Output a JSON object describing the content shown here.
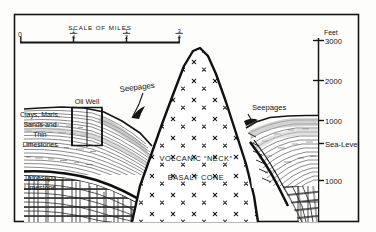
{
  "figure": {
    "kind": "geological-cross-section",
    "scale_bar": {
      "title": "SCALE OF MILES",
      "ticks": [
        {
          "label_num": "",
          "label_den": "",
          "label_whole": "0",
          "pos": 0.0
        },
        {
          "label_num": "1",
          "label_den": "4",
          "label_whole": "",
          "pos": 0.3333
        },
        {
          "label_num": "1",
          "label_den": "2",
          "label_whole": "",
          "pos": 0.6667
        },
        {
          "label_num": "3",
          "label_den": "4",
          "label_whole": "",
          "pos": 1.0
        }
      ]
    },
    "elevation_axis": {
      "unit_label": "Feet",
      "ticks": [
        {
          "label": "3000",
          "y": 40
        },
        {
          "label": "2000",
          "y": 80
        },
        {
          "label": "1000",
          "y": 120
        },
        {
          "label": "Sea-Level",
          "y": 143
        },
        {
          "label": "1000",
          "y": 180
        }
      ]
    },
    "left_legend": [
      {
        "line": "Clays, Marls,"
      },
      {
        "line": "Sands and"
      },
      {
        "line": "Thin"
      },
      {
        "line": "Limestones"
      }
    ],
    "left_legend_lower": [
      {
        "line": "Tamasopo"
      },
      {
        "line": "Limestone"
      }
    ],
    "annotations": {
      "oil_well": "Oil Well",
      "seepages_left": "Seepages",
      "seepages_right": "Seepages",
      "volcanic_neck": "VOLCANIC “NECK”",
      "basalt_cone": "BASALT CONE"
    },
    "colors": {
      "ink": "#151515",
      "paper": "#fdfdfb",
      "shade": "#b9b9b9",
      "light_shade": "#d8d8d8"
    }
  }
}
